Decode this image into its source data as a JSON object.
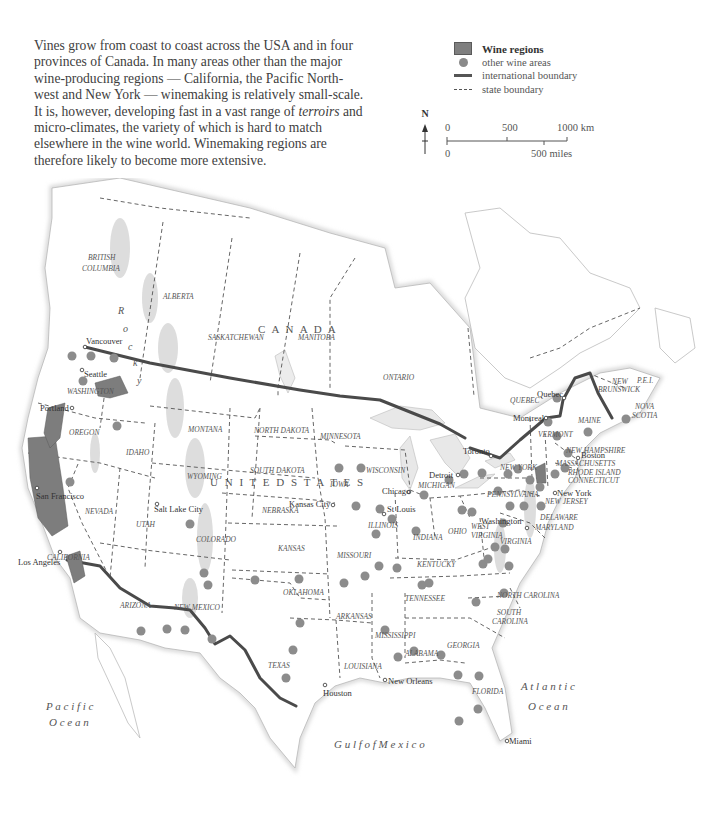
{
  "intro": {
    "text_before_italic": "Vines grow from coast to coast across the USA and in four provinces of Canada. In many areas other than the major wine-producing regions — California, the Pacific North-west and New York — winemaking is relatively small-scale. It is, however, developing fast in a vast range of ",
    "italic": "terroirs",
    "text_after_italic": " and micro-climates, the variety of which is hard to match elsewhere in the wine world. Winemaking regions are therefore likely to become more extensive."
  },
  "legend": {
    "items": [
      {
        "key": "wine-regions",
        "label": "Wine regions"
      },
      {
        "key": "other-wine-areas",
        "label": "other wine areas"
      },
      {
        "key": "international-boundary",
        "label": "international boundary"
      },
      {
        "key": "state-boundary",
        "label": "state boundary"
      }
    ]
  },
  "north_arrow": {
    "label": "N"
  },
  "scale_bar": {
    "km_ticks": [
      "0",
      "500",
      "1000 km"
    ],
    "mile_ticks": [
      "0",
      "500 miles"
    ]
  },
  "colors": {
    "wine_region": "#7d7d7d",
    "wine_dot": "#8c8c8c",
    "intl_boundary": "#4a4a4a",
    "state_boundary": "#555555",
    "coast": "#c8c8c8",
    "label": "#555555"
  },
  "map": {
    "country_labels": [
      {
        "text": "C  A  N  A  D  A",
        "x": 258,
        "y": 155
      },
      {
        "text": "U  N  I  T  E  D    S  T  A  T  E  S",
        "x": 210,
        "y": 308
      }
    ],
    "province_labels": [
      {
        "text": "BRITISH",
        "x": 88,
        "y": 82
      },
      {
        "text": "COLUMBIA",
        "x": 82,
        "y": 93
      },
      {
        "text": "ALBERTA",
        "x": 163,
        "y": 121
      },
      {
        "text": "SASKATCHEWAN",
        "x": 208,
        "y": 162
      },
      {
        "text": "MANITOBA",
        "x": 298,
        "y": 162
      },
      {
        "text": "ONTARIO",
        "x": 383,
        "y": 202
      },
      {
        "text": "QUEBEC",
        "x": 510,
        "y": 225
      },
      {
        "text": "NEW",
        "x": 612,
        "y": 206
      },
      {
        "text": "BRUNSWICK",
        "x": 598,
        "y": 214
      },
      {
        "text": "P.E.I.",
        "x": 637,
        "y": 205
      },
      {
        "text": "NOVA",
        "x": 635,
        "y": 231
      },
      {
        "text": "SCOTIA",
        "x": 632,
        "y": 240
      }
    ],
    "state_labels": [
      {
        "text": "WASHINGTON",
        "x": 67,
        "y": 216
      },
      {
        "text": "OREGON",
        "x": 69,
        "y": 257
      },
      {
        "text": "IDAHO",
        "x": 126,
        "y": 277
      },
      {
        "text": "MONTANA",
        "x": 188,
        "y": 254
      },
      {
        "text": "WYOMING",
        "x": 187,
        "y": 301
      },
      {
        "text": "NORTH DAKOTA",
        "x": 254,
        "y": 255
      },
      {
        "text": "SOUTH DAKOTA",
        "x": 250,
        "y": 295
      },
      {
        "text": "MINNESOTA",
        "x": 320,
        "y": 261
      },
      {
        "text": "WISCONSIN",
        "x": 366,
        "y": 295
      },
      {
        "text": "MICHIGAN",
        "x": 418,
        "y": 310
      },
      {
        "text": "IOWA",
        "x": 330,
        "y": 309
      },
      {
        "text": "NEBRASKA",
        "x": 262,
        "y": 335
      },
      {
        "text": "NEVADA",
        "x": 85,
        "y": 336
      },
      {
        "text": "UTAH",
        "x": 136,
        "y": 349
      },
      {
        "text": "COLORADO",
        "x": 196,
        "y": 364
      },
      {
        "text": "KANSAS",
        "x": 278,
        "y": 373
      },
      {
        "text": "ILLINOIS",
        "x": 368,
        "y": 350
      },
      {
        "text": "INDIANA",
        "x": 413,
        "y": 362
      },
      {
        "text": "OHIO",
        "x": 448,
        "y": 356
      },
      {
        "text": "MISSOURI",
        "x": 337,
        "y": 380
      },
      {
        "text": "KENTUCKY",
        "x": 417,
        "y": 389
      },
      {
        "text": "CALIFORNIA",
        "x": 47,
        "y": 382
      },
      {
        "text": "ARIZONA",
        "x": 120,
        "y": 430
      },
      {
        "text": "NEW MEXICO",
        "x": 174,
        "y": 432
      },
      {
        "text": "OKLAHOMA",
        "x": 283,
        "y": 417
      },
      {
        "text": "TENNESSEE",
        "x": 405,
        "y": 423
      },
      {
        "text": "ARKANSAS",
        "x": 336,
        "y": 441
      },
      {
        "text": "NORTH CAROLINA",
        "x": 497,
        "y": 420
      },
      {
        "text": "SOUTH",
        "x": 497,
        "y": 437
      },
      {
        "text": "CAROLINA",
        "x": 492,
        "y": 446
      },
      {
        "text": "TEXAS",
        "x": 268,
        "y": 490
      },
      {
        "text": "MISSISSIPPI",
        "x": 375,
        "y": 460
      },
      {
        "text": "ALABAMA",
        "x": 405,
        "y": 478
      },
      {
        "text": "GEORGIA",
        "x": 447,
        "y": 470
      },
      {
        "text": "LOUISIANA",
        "x": 344,
        "y": 491
      },
      {
        "text": "FLORIDA",
        "x": 472,
        "y": 516
      },
      {
        "text": "NEW YORK",
        "x": 500,
        "y": 292
      },
      {
        "text": "PENNSYLVANIA",
        "x": 487,
        "y": 319
      },
      {
        "text": "VERMONT",
        "x": 538,
        "y": 259
      },
      {
        "text": "NEW HAMPSHIRE",
        "x": 566,
        "y": 275
      },
      {
        "text": "MAINE",
        "x": 578,
        "y": 245
      },
      {
        "text": "MASSACHUSETTS",
        "x": 556,
        "y": 288
      },
      {
        "text": "RHODE ISLAND",
        "x": 568,
        "y": 297
      },
      {
        "text": "CONNECTICUT",
        "x": 568,
        "y": 305
      },
      {
        "text": "NEW JERSEY",
        "x": 545,
        "y": 326
      },
      {
        "text": "DELAWARE",
        "x": 540,
        "y": 342
      },
      {
        "text": "MARYLAND",
        "x": 535,
        "y": 352
      },
      {
        "text": "WEST",
        "x": 471,
        "y": 351
      },
      {
        "text": "VIRGINIA",
        "x": 471,
        "y": 360
      },
      {
        "text": "VIRGINIA",
        "x": 500,
        "y": 366
      }
    ],
    "cities": [
      {
        "name": "Vancouver",
        "x": 85,
        "y": 169,
        "lx": 86,
        "ly": 166
      },
      {
        "name": "Seattle",
        "x": 82,
        "y": 192,
        "lx": 84,
        "ly": 199
      },
      {
        "name": "Portland",
        "x": 72,
        "y": 230,
        "lx": 40,
        "ly": 233
      },
      {
        "name": "San Francisco",
        "x": 37,
        "y": 310,
        "lx": 36,
        "ly": 321
      },
      {
        "name": "Los Angeles",
        "x": 60,
        "y": 374,
        "lx": 18,
        "ly": 387
      },
      {
        "name": "Salt Lake City",
        "x": 157,
        "y": 326,
        "lx": 154,
        "ly": 334
      },
      {
        "name": "Kansas City",
        "x": 333,
        "y": 327,
        "lx": 289,
        "ly": 329
      },
      {
        "name": "St Louis",
        "x": 384,
        "y": 336,
        "lx": 387,
        "ly": 334
      },
      {
        "name": "Chicago",
        "x": 409,
        "y": 314,
        "lx": 382,
        "ly": 316
      },
      {
        "name": "Detroit",
        "x": 458,
        "y": 297,
        "lx": 429,
        "ly": 300
      },
      {
        "name": "Toronto",
        "x": 491,
        "y": 278,
        "lx": 463,
        "ly": 276
      },
      {
        "name": "Montreal",
        "x": 546,
        "y": 240,
        "lx": 513,
        "ly": 243
      },
      {
        "name": "Quebec",
        "x": 564,
        "y": 220,
        "lx": 537,
        "ly": 219
      },
      {
        "name": "Boston",
        "x": 578,
        "y": 280,
        "lx": 581,
        "ly": 280
      },
      {
        "name": "New York",
        "x": 555,
        "y": 315,
        "lx": 557,
        "ly": 318
      },
      {
        "name": "Washington",
        "x": 527,
        "y": 350,
        "lx": 481,
        "ly": 346
      },
      {
        "name": "Houston",
        "x": 325,
        "y": 507,
        "lx": 323,
        "ly": 518
      },
      {
        "name": "New Orleans",
        "x": 385,
        "y": 502,
        "lx": 388,
        "ly": 506
      },
      {
        "name": "Miami",
        "x": 507,
        "y": 563,
        "lx": 509,
        "ly": 566
      }
    ],
    "water_labels": [
      {
        "text": "P a c i f i c",
        "x": 46,
        "y": 532
      },
      {
        "text": "O c e a n",
        "x": 49,
        "y": 548
      },
      {
        "text": "A t l a n t i c",
        "x": 521,
        "y": 512
      },
      {
        "text": "O c e a n",
        "x": 528,
        "y": 532
      },
      {
        "text": "G u l f   o f   M e x i c o",
        "x": 334,
        "y": 570
      }
    ],
    "feature_labels": [
      {
        "text": "R",
        "x": 118,
        "y": 136
      },
      {
        "text": "o",
        "x": 123,
        "y": 154
      },
      {
        "text": "c",
        "x": 128,
        "y": 172
      },
      {
        "text": "k",
        "x": 133,
        "y": 188
      },
      {
        "text": "y",
        "x": 137,
        "y": 206
      }
    ]
  }
}
